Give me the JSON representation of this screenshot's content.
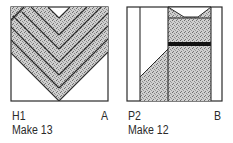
{
  "blocks": [
    {
      "id": "H1",
      "code": "H1",
      "letter": "A",
      "quantity": "Make 13",
      "pattern": "chevron-heart"
    },
    {
      "id": "P2",
      "code": "P2",
      "letter": "B",
      "quantity": "Make 12",
      "pattern": "column-with-notch-and-bar"
    }
  ],
  "colors": {
    "outline": "#2b2b2b",
    "stipple_base": "#c9c9c9",
    "stipple_dot": "#6a6a6a",
    "bar": "#111111",
    "background": "#ffffff"
  }
}
